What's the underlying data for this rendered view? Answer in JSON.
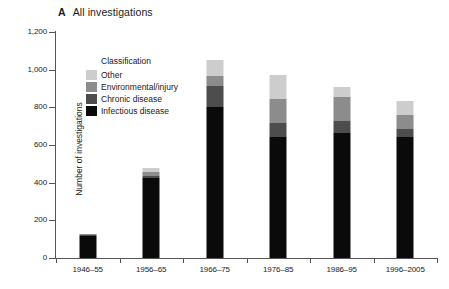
{
  "figure": {
    "panel_letter": "A",
    "panel_title": "All investigations"
  },
  "chart_data": {
    "type": "bar",
    "subtype": "stacked-bar",
    "title": "All investigations",
    "panel_label": "A",
    "xlabel": "",
    "ylabel": "Number of investigations",
    "ylim": [
      0,
      1200
    ],
    "yticks": [
      0,
      200,
      400,
      600,
      800,
      1000,
      1200
    ],
    "ytick_labels": [
      "0",
      "200",
      "400",
      "600",
      "800",
      "1,000",
      "1,200"
    ],
    "grid": false,
    "legend_title": "Classification",
    "legend_position": "inside-upper-left",
    "stack_order_bottom_to_top": [
      "Infectious disease",
      "Chronic disease",
      "Environmental/injury",
      "Other"
    ],
    "categories": [
      "1946–55",
      "1956–65",
      "1966–75",
      "1976–85",
      "1986–95",
      "1996–2005"
    ],
    "series": [
      {
        "name": "Infectious disease",
        "color": "#0a0a0a",
        "values": [
          115,
          425,
          800,
          640,
          665,
          645
        ]
      },
      {
        "name": "Chronic disease",
        "color": "#4d4d4d",
        "values": [
          6,
          12,
          115,
          75,
          60,
          40
        ]
      },
      {
        "name": "Environmental/injury",
        "color": "#8c8c8c",
        "values": [
          4,
          18,
          50,
          130,
          130,
          75
        ]
      },
      {
        "name": "Other",
        "color": "#cdcdcd",
        "values": [
          3,
          23,
          85,
          125,
          55,
          75
        ]
      }
    ],
    "totals": [
      128,
      478,
      1050,
      970,
      910,
      835
    ]
  }
}
